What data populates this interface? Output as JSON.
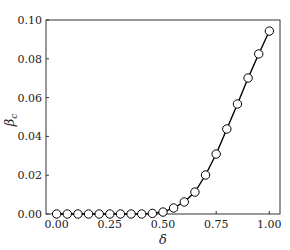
{
  "chart_data": {
    "type": "line",
    "title": "",
    "xlabel": "δ",
    "ylabel": "β_c",
    "xlim": [
      -0.05,
      1.05
    ],
    "ylim": [
      0.0,
      0.1
    ],
    "x_ticks": [
      0.0,
      0.25,
      0.5,
      0.75,
      1.0
    ],
    "x_tick_labels": [
      "0.00",
      "0.25",
      "0.50",
      "0.75",
      "1.00"
    ],
    "y_ticks": [
      0.0,
      0.02,
      0.04,
      0.06,
      0.08,
      0.1
    ],
    "y_tick_labels": [
      "0.00",
      "0.02",
      "0.04",
      "0.06",
      "0.08",
      "0.10"
    ],
    "grid": false,
    "legend": null,
    "series": [
      {
        "name": "β_c",
        "marker": "open-circle",
        "line_color": "#000000",
        "x": [
          0.0,
          0.05,
          0.1,
          0.15,
          0.2,
          0.25,
          0.3,
          0.35,
          0.4,
          0.45,
          0.5,
          0.55,
          0.6,
          0.65,
          0.7,
          0.75,
          0.8,
          0.85,
          0.9,
          0.95,
          1.0
        ],
        "values": [
          0.0,
          0.0,
          0.0,
          0.0,
          0.0,
          0.0,
          0.0,
          0.0,
          0.0,
          0.0003,
          0.001,
          0.0031,
          0.0062,
          0.0113,
          0.0201,
          0.0309,
          0.0438,
          0.0567,
          0.0701,
          0.0825,
          0.0943
        ]
      }
    ]
  }
}
